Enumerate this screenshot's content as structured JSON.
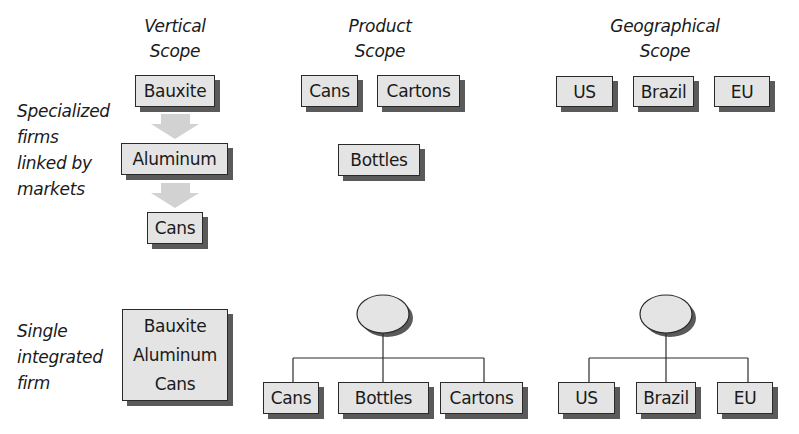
{
  "columns": {
    "vertical": {
      "title_line1": "Vertical",
      "title_line2": "Scope"
    },
    "product": {
      "title_line1": "Product",
      "title_line2": "Scope"
    },
    "geographical": {
      "title_line1": "Geographical",
      "title_line2": "Scope"
    }
  },
  "rows": {
    "specialized": {
      "label_lines": [
        "Specialized",
        "firms",
        "linked by",
        "markets"
      ]
    },
    "integrated": {
      "label_lines": [
        "Single",
        "integrated",
        "firm"
      ]
    }
  },
  "specialized": {
    "vertical": [
      "Bauxite",
      "Aluminum",
      "Cans"
    ],
    "product": [
      "Cans",
      "Cartons",
      "Bottles"
    ],
    "geographical": [
      "US",
      "Brazil",
      "EU"
    ]
  },
  "integrated": {
    "vertical": [
      "Bauxite",
      "Aluminum",
      "Cans"
    ],
    "product": [
      "Cans",
      "Bottles",
      "Cartons"
    ],
    "geographical": [
      "US",
      "Brazil",
      "EU"
    ]
  },
  "colors": {
    "box_fill": "#e4e4e4",
    "box_border": "#2a2a2a",
    "shadow": "#5a5a5a",
    "arrow": "#d2d2d2",
    "connector": "#2a2a2a"
  }
}
